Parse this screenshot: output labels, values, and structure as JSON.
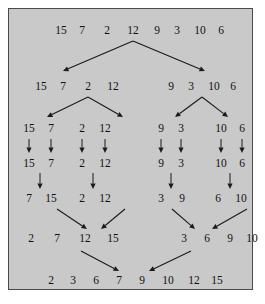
{
  "figure": {
    "background_color": "#c9c9c9",
    "border_color": "#4a4a4a",
    "text_color": "#111111"
  },
  "chart_data": {
    "type": "diagram",
    "algorithm": "merge sort",
    "input": [
      15,
      7,
      2,
      12,
      9,
      3,
      10,
      6
    ],
    "output": [
      2,
      3,
      6,
      7,
      9,
      10,
      12,
      15
    ],
    "phases": [
      "divide",
      "divide",
      "divide",
      "base",
      "merge",
      "merge",
      "merge"
    ],
    "rows": [
      {
        "id": "row1",
        "phase": "divide",
        "y": 22,
        "groups": [
          {
            "values": [
              15,
              7,
              2,
              12,
              9,
              3,
              10,
              6
            ],
            "x": [
              52,
              73,
              98,
              124,
              148,
              168,
              191,
              212
            ]
          }
        ]
      },
      {
        "id": "row2",
        "phase": "divide",
        "y": 78,
        "groups": [
          {
            "values": [
              15,
              7,
              2,
              12
            ],
            "x": [
              32,
              54,
              79,
              104
            ]
          },
          {
            "values": [
              9,
              3,
              10,
              6
            ],
            "x": [
              162,
              182,
              205,
              224
            ]
          }
        ]
      },
      {
        "id": "row3",
        "phase": "divide",
        "y": 120,
        "groups": [
          {
            "values": [
              15,
              7
            ],
            "x": [
              20,
              42
            ]
          },
          {
            "values": [
              2,
              12
            ],
            "x": [
              73,
              96
            ]
          },
          {
            "values": [
              9,
              3
            ],
            "x": [
              152,
              172
            ]
          },
          {
            "values": [
              10,
              6
            ],
            "x": [
              212,
              233
            ]
          }
        ]
      },
      {
        "id": "row4",
        "phase": "base",
        "y": 155,
        "groups": [
          {
            "values": [
              15,
              7
            ],
            "x": [
              20,
              42
            ]
          },
          {
            "values": [
              2,
              12
            ],
            "x": [
              73,
              96
            ]
          },
          {
            "values": [
              9,
              3
            ],
            "x": [
              152,
              172
            ]
          },
          {
            "values": [
              10,
              6
            ],
            "x": [
              212,
              233
            ]
          }
        ]
      },
      {
        "id": "row5",
        "phase": "merge",
        "y": 190,
        "groups": [
          {
            "values": [
              7,
              15
            ],
            "x": [
              20,
              42
            ]
          },
          {
            "values": [
              2,
              12
            ],
            "x": [
              73,
              96
            ]
          },
          {
            "values": [
              3,
              9
            ],
            "x": [
              152,
              173
            ]
          },
          {
            "values": [
              6,
              10
            ],
            "x": [
              209,
              232
            ]
          }
        ]
      },
      {
        "id": "row6",
        "phase": "merge",
        "y": 230,
        "groups": [
          {
            "values": [
              2,
              7,
              12,
              15
            ],
            "x": [
              22,
              48,
              76,
              104
            ]
          },
          {
            "values": [
              3,
              6,
              9,
              10
            ],
            "x": [
              175,
              198,
              221,
              243
            ]
          }
        ]
      },
      {
        "id": "row7",
        "phase": "merge",
        "y": 272,
        "groups": [
          {
            "values": [
              2,
              3,
              6,
              7,
              9,
              10,
              12,
              15
            ],
            "x": [
              42,
              64,
              87,
              110,
              133,
              159,
              185,
              208
            ]
          }
        ]
      }
    ],
    "arrows": [
      {
        "from": [
          124,
          32
        ],
        "to": [
          54,
          62
        ],
        "kind": "split"
      },
      {
        "from": [
          124,
          32
        ],
        "to": [
          196,
          62
        ],
        "kind": "split"
      },
      {
        "from": [
          79,
          88
        ],
        "to": [
          38,
          108
        ],
        "kind": "split"
      },
      {
        "from": [
          79,
          88
        ],
        "to": [
          114,
          108
        ],
        "kind": "split"
      },
      {
        "from": [
          193,
          88
        ],
        "to": [
          166,
          108
        ],
        "kind": "split"
      },
      {
        "from": [
          193,
          88
        ],
        "to": [
          219,
          108
        ],
        "kind": "split"
      },
      {
        "from": [
          20,
          130
        ],
        "to": [
          20,
          144
        ],
        "kind": "down"
      },
      {
        "from": [
          42,
          130
        ],
        "to": [
          42,
          144
        ],
        "kind": "down"
      },
      {
        "from": [
          73,
          130
        ],
        "to": [
          73,
          144
        ],
        "kind": "down"
      },
      {
        "from": [
          96,
          130
        ],
        "to": [
          96,
          144
        ],
        "kind": "down"
      },
      {
        "from": [
          152,
          130
        ],
        "to": [
          152,
          144
        ],
        "kind": "down"
      },
      {
        "from": [
          172,
          130
        ],
        "to": [
          172,
          144
        ],
        "kind": "down"
      },
      {
        "from": [
          212,
          130
        ],
        "to": [
          212,
          144
        ],
        "kind": "down"
      },
      {
        "from": [
          233,
          130
        ],
        "to": [
          233,
          144
        ],
        "kind": "down"
      },
      {
        "from": [
          31,
          164
        ],
        "to": [
          31,
          180
        ],
        "kind": "down"
      },
      {
        "from": [
          84,
          164
        ],
        "to": [
          84,
          180
        ],
        "kind": "down"
      },
      {
        "from": [
          162,
          164
        ],
        "to": [
          162,
          180
        ],
        "kind": "down"
      },
      {
        "from": [
          221,
          164
        ],
        "to": [
          221,
          180
        ],
        "kind": "down"
      },
      {
        "from": [
          48,
          200
        ],
        "to": [
          78,
          220
        ],
        "kind": "merge"
      },
      {
        "from": [
          116,
          200
        ],
        "to": [
          92,
          220
        ],
        "kind": "merge"
      },
      {
        "from": [
          163,
          200
        ],
        "to": [
          186,
          220
        ],
        "kind": "merge"
      },
      {
        "from": [
          238,
          200
        ],
        "to": [
          203,
          220
        ],
        "kind": "merge"
      },
      {
        "from": [
          72,
          242
        ],
        "to": [
          110,
          262
        ],
        "kind": "merge"
      },
      {
        "from": [
          182,
          242
        ],
        "to": [
          140,
          262
        ],
        "kind": "merge"
      }
    ]
  }
}
